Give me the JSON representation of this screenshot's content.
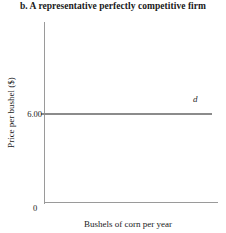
{
  "chart_data": {
    "type": "line",
    "title": "b. A representative perfectly competitive firm",
    "xlabel": "Bushels of corn per year",
    "ylabel": "Price per bushel ($)",
    "origin_label": "0",
    "grid": false,
    "legend": "none",
    "xlim": [
      0,
      100
    ],
    "ylim": [
      0,
      10
    ],
    "y_ticks": [
      "6.00"
    ],
    "y_tick_values": [
      6.0
    ],
    "x_ticks": [],
    "series": [
      {
        "name": "d",
        "annotation": "d",
        "type": "horizontal-line",
        "y_value": 6.0,
        "x": [
          0,
          100
        ],
        "values": [
          6.0,
          6.0
        ],
        "color": "#8b8b8b"
      }
    ],
    "annotations": [
      {
        "text": "d",
        "style": "italic",
        "near": "right end of demand line"
      }
    ],
    "axis_color": "#9a9a9a"
  }
}
